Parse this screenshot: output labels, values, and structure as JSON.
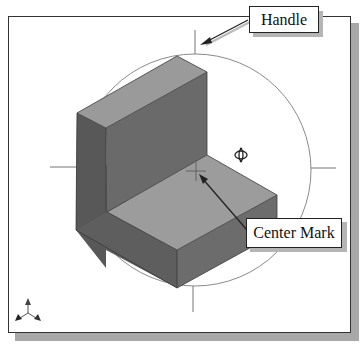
{
  "callouts": {
    "handle": {
      "label": "Handle"
    },
    "center_mark": {
      "label": "Center Mark"
    }
  },
  "icons": {
    "rotate_cursor": "rotate-cursor-icon",
    "triad": "xyz-triad-icon"
  },
  "colors": {
    "top_face": "#9a9a9a",
    "left_face": "#5a5a5a",
    "right_face": "#6e6e6e",
    "floor": "#9c9c9c",
    "circle": "#888888",
    "frame_shadow": "#a8a8a8"
  }
}
